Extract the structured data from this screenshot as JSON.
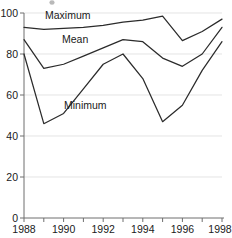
{
  "chart_data": {
    "type": "line",
    "title": "",
    "subtitle": "",
    "xlabel": "",
    "ylabel": "",
    "x": [
      1988,
      1989,
      1990,
      1991,
      1992,
      1993,
      1994,
      1995,
      1996,
      1997,
      1998
    ],
    "categories": [
      "1988",
      "1989",
      "1990",
      "1991",
      "1992",
      "1993",
      "1994",
      "1995",
      "1996",
      "1997",
      "1998"
    ],
    "series": [
      {
        "name": "Maximum",
        "values": [
          93,
          92,
          92.5,
          93,
          94,
          95.5,
          96.5,
          98.5,
          86.5,
          91,
          97
        ]
      },
      {
        "name": "Mean",
        "values": [
          87,
          73,
          75,
          79,
          83,
          87,
          86,
          78,
          74,
          80,
          93
        ]
      },
      {
        "name": "Minimum",
        "values": [
          80,
          46,
          51,
          63,
          75,
          80,
          68,
          47,
          55,
          72,
          86
        ]
      }
    ],
    "xlim": [
      1988,
      1998
    ],
    "ylim": [
      0,
      100
    ],
    "x_ticks": [
      1988,
      1989,
      1990,
      1991,
      1992,
      1993,
      1994,
      1995,
      1996,
      1997,
      1998
    ],
    "x_tick_labels": [
      "1988",
      "",
      "1990",
      "",
      "1992",
      "",
      "1994",
      "",
      "1996",
      "",
      "1998"
    ],
    "y_ticks": [
      0,
      20,
      40,
      60,
      80,
      100
    ],
    "y_tick_labels": [
      "0",
      "20",
      "40",
      "60",
      "80",
      "100"
    ],
    "grid": "horizontal",
    "legend": "inline-labels",
    "annotations": [
      {
        "text": "Maximum",
        "x": 1990.0,
        "y": 99.0
      },
      {
        "text": "Mean",
        "x": 1991.7,
        "y": 91.5
      },
      {
        "text": "Minimum",
        "x": 1991.6,
        "y": 61.0
      }
    ]
  },
  "axes": {
    "y_ticks": [
      "100",
      "80",
      "60",
      "40",
      "20",
      "0"
    ],
    "x_ticks": [
      "1988",
      "1990",
      "1992",
      "1994",
      "1996",
      "1998"
    ]
  },
  "labels": {
    "maximum": "Maximum",
    "mean": "Mean",
    "minimum": "Minimum"
  },
  "colors": {
    "line": "#2b2b2b",
    "grid": "#d8d8d8",
    "axis": "#6e6e6e",
    "text": "#1a1a1a",
    "background": "#ffffff"
  }
}
